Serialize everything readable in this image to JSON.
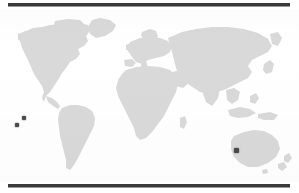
{
  "figure": {
    "type": "world-distribution-map",
    "background_color": "#ffffff",
    "land_color": "#d9d9d9",
    "rule_color": "#3a3a3a",
    "marker_color": "#4a4a4a",
    "caption": "",
    "title": ""
  },
  "rules": {
    "top_label": "top-rule",
    "bottom_label": "bottom-rule"
  },
  "map": {
    "projection": "equirectangular",
    "label": "world-map",
    "regions": [
      "North America",
      "South America",
      "Europe",
      "Africa",
      "Asia",
      "Australia",
      "New Zealand",
      "Greenland",
      "Indonesia",
      "Japan",
      "Madagascar",
      "British Isles"
    ]
  },
  "chart_data": {
    "type": "scatter",
    "title": "",
    "xlabel": "Longitude",
    "ylabel": "Latitude",
    "xlim": [
      -180,
      180
    ],
    "ylim": [
      -90,
      90
    ],
    "grid": false,
    "legend": null,
    "series": [
      {
        "name": "Occurrence records",
        "marker": "square",
        "color": "#4a4a4a",
        "points": [
          {
            "id": "point-1",
            "px": 24,
            "py": 118,
            "label": "South Pacific point (upper)"
          },
          {
            "id": "point-2",
            "px": 17,
            "py": 125,
            "label": "South Pacific point (lower)"
          },
          {
            "id": "point-3",
            "px": 236,
            "py": 150,
            "label": "Southwest Australia point"
          }
        ]
      }
    ]
  },
  "markers": [
    {
      "name": "marker-point-1",
      "left": 22,
      "top": 115,
      "size": 4
    },
    {
      "name": "marker-point-2",
      "left": 15,
      "top": 123,
      "size": 4
    },
    {
      "name": "marker-point-3",
      "left": 234,
      "top": 147,
      "size": 5
    }
  ]
}
